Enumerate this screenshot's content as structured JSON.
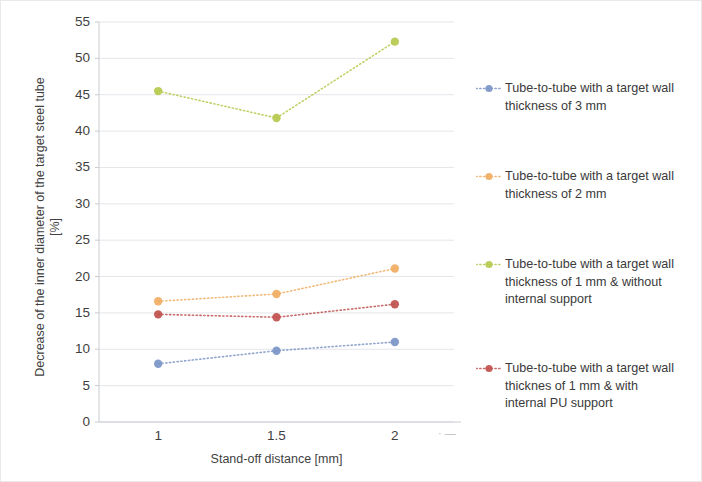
{
  "chart_data": {
    "type": "scatter",
    "title": "",
    "xlabel": "Stand-off distance [mm]",
    "ylabel": "Decrease of the inner diameter of  the target steel tube\n[%]",
    "x": [
      1,
      1.5,
      2
    ],
    "xtick_labels": [
      "1",
      "1.5",
      "2"
    ],
    "xlim": [
      0.75,
      2.25
    ],
    "ylim": [
      0,
      55
    ],
    "ytick_labels": [
      "0",
      "5",
      "10",
      "15",
      "20",
      "25",
      "30",
      "35",
      "40",
      "45",
      "50",
      "55"
    ],
    "ytick_values": [
      0,
      5,
      10,
      15,
      20,
      25,
      30,
      35,
      40,
      45,
      50,
      55
    ],
    "grid": true,
    "grid_axis": "y",
    "legend_position": "right",
    "marker": "circle",
    "linestyle": "dotted",
    "series": [
      {
        "name": "Tube-to-tube with a target wall thickness of 3 mm",
        "color": "#7b95c7",
        "values": [
          8.0,
          9.8,
          11.0
        ]
      },
      {
        "name": "Tube-to-tube with a target wall thickness of 2 mm",
        "color": "#f0ad62",
        "values": [
          16.6,
          17.6,
          21.1
        ]
      },
      {
        "name": "Tube-to-tube with a target wall thickness of 1 mm & without internal support",
        "color": "#b6c94e",
        "values": [
          45.5,
          41.8,
          52.3
        ]
      },
      {
        "name": "Tube-to-tube with a target wall thicknes of 1 mm & with internal PU support",
        "color": "#c0504d",
        "values": [
          14.8,
          14.4,
          16.2
        ]
      }
    ]
  },
  "legend": {
    "entries": [
      {
        "label": "Tube-to-tube with a target wall\nthickness of 3 mm",
        "color": "#7b95c7",
        "marker_name": "legend-marker-blue"
      },
      {
        "label": "Tube-to-tube with a target wall\nthickness of 2 mm",
        "color": "#f0ad62",
        "marker_name": "legend-marker-orange"
      },
      {
        "label": "Tube-to-tube with a target wall\nthickness of 1 mm & without\ninternal support",
        "color": "#b6c94e",
        "marker_name": "legend-marker-green"
      },
      {
        "label": "Tube-to-tube with a target wall\nthicknes of 1 mm & with\ninternal PU support",
        "color": "#c0504d",
        "marker_name": "legend-marker-red"
      }
    ]
  },
  "axes": {
    "y_title": "Decrease of the inner diameter of  the target steel tube\n[%]",
    "x_title": "Stand-off distance [mm]",
    "y_ticks": [
      "55",
      "50",
      "45",
      "40",
      "35",
      "30",
      "25",
      "20",
      "15",
      "10",
      "5",
      "0"
    ],
    "x_ticks": [
      "1",
      "1.5",
      "2"
    ]
  },
  "style": {
    "grid_color": "#e4e6ea",
    "axis_color": "#c9ccd1",
    "text_color": "#3f3f3f"
  }
}
